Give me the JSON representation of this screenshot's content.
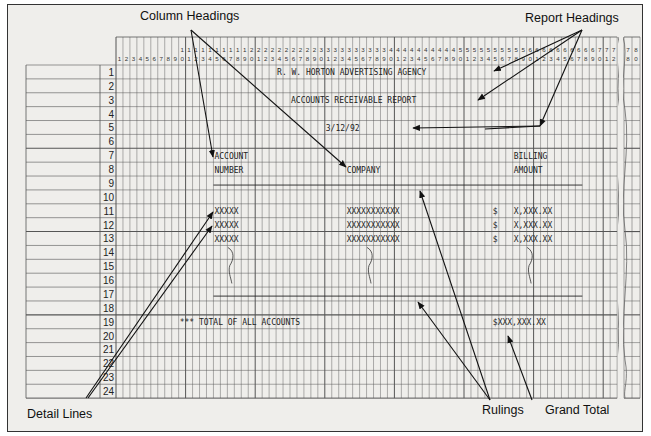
{
  "callouts": {
    "column_headings": "Column Headings",
    "report_headings": "Report Headings",
    "detail_lines": "Detail Lines",
    "rulings": "Rulings",
    "grand_total": "Grand Total"
  },
  "grid": {
    "columns_shown": "1-72, 78-80 (columns 73-77 omitted by break)",
    "rows": [
      "1",
      "2",
      "3",
      "4",
      "5",
      "6",
      "7",
      "8",
      "9",
      "10",
      "11",
      "12",
      "13",
      "14",
      "15",
      "16",
      "17",
      "18",
      "19",
      "20",
      "21",
      "22",
      "23",
      "24"
    ]
  },
  "report": {
    "heading_line_1": "R. W. HORTON ADVERTISING AGENCY",
    "heading_line_2": "ACCOUNTS RECEIVABLE REPORT",
    "heading_date": "3/12/92",
    "col1_line1": "ACCOUNT",
    "col1_line2": "NUMBER",
    "col2_line1": "COMPANY",
    "col3_line1": "BILLING",
    "col3_line2": "AMOUNT",
    "detail_account": "XXXXX",
    "detail_company": "XXXXXXXXXXX",
    "detail_dollar": "$",
    "detail_amount": "X,XXX.XX",
    "total_label": "*** TOTAL OF ALL ACCOUNTS",
    "grand_total": "$XXX,XXX.XX"
  },
  "colors": {
    "background": "#efeeeb",
    "grid_line": "#555555",
    "ink": "#111111"
  }
}
